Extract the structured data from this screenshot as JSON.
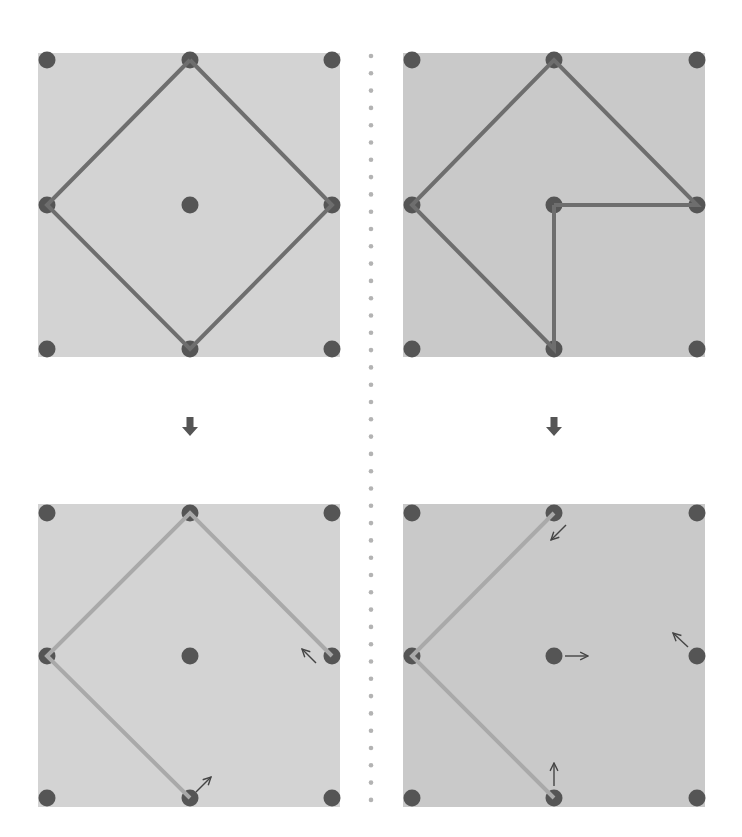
{
  "diagram": {
    "title": "",
    "colors": {
      "background": "#ffffff",
      "panel_left_bg": "#d3d3d3",
      "panel_right_bg": "#c9c9c9",
      "dot": "#555555",
      "line_top": "#6e6e6e",
      "line_bottom": "#a9a9a9",
      "arrow_small": "#444444",
      "arrow_big": "#555555",
      "divider_dot": "#b3b3b3"
    },
    "divider": {
      "x": 371,
      "y_start": 56,
      "y_end": 802,
      "spacing": 17.3,
      "radius": 2.3
    },
    "transition_arrows": [
      {
        "name": "down-arrow-left",
        "x": 190,
        "y": 427
      },
      {
        "name": "down-arrow-right",
        "x": 554,
        "y": 427
      }
    ],
    "panels": [
      {
        "name": "panel-top-left",
        "rect": {
          "x": 38,
          "y": 53,
          "w": 302,
          "h": 304
        },
        "bg": "panel_left_bg",
        "grid_x": [
          47,
          190,
          332
        ],
        "grid_y": [
          60,
          205,
          349
        ],
        "line_color": "line_top",
        "polylines": [
          [
            [
              1,
              0
            ],
            [
              2,
              1
            ],
            [
              1,
              2
            ],
            [
              0,
              1
            ],
            [
              1,
              0
            ]
          ]
        ],
        "small_arrows": []
      },
      {
        "name": "panel-top-right",
        "rect": {
          "x": 403,
          "y": 53,
          "w": 302,
          "h": 304
        },
        "bg": "panel_right_bg",
        "grid_x": [
          412,
          554,
          697
        ],
        "grid_y": [
          60,
          205,
          349
        ],
        "line_color": "line_top",
        "polylines": [
          [
            [
              1,
              1
            ],
            [
              2,
              1
            ],
            [
              1,
              0
            ],
            [
              0,
              1
            ],
            [
              1,
              2
            ],
            [
              1,
              1
            ]
          ]
        ],
        "small_arrows": []
      },
      {
        "name": "panel-bottom-left",
        "rect": {
          "x": 38,
          "y": 504,
          "w": 302,
          "h": 303
        },
        "bg": "panel_left_bg",
        "grid_x": [
          47,
          190,
          332
        ],
        "grid_y": [
          513,
          656,
          798
        ],
        "line_color": "line_bottom",
        "polylines": [
          [
            [
              2,
              1
            ],
            [
              1,
              0
            ],
            [
              0,
              1
            ],
            [
              1,
              2
            ]
          ]
        ],
        "small_arrows": [
          {
            "x1": 316,
            "y1": 663,
            "x2": 302,
            "y2": 649,
            "direction": "up-left"
          },
          {
            "x1": 196,
            "y1": 792,
            "x2": 211,
            "y2": 777,
            "direction": "up-right"
          }
        ]
      },
      {
        "name": "panel-bottom-right",
        "rect": {
          "x": 403,
          "y": 504,
          "w": 302,
          "h": 303
        },
        "bg": "panel_right_bg",
        "grid_x": [
          412,
          554,
          697
        ],
        "grid_y": [
          513,
          656,
          798
        ],
        "line_color": "line_bottom",
        "polylines": [
          [
            [
              1,
              0
            ],
            [
              0,
              1
            ],
            [
              1,
              2
            ]
          ]
        ],
        "small_arrows": [
          {
            "x1": 566,
            "y1": 525,
            "x2": 551,
            "y2": 540,
            "direction": "down-left"
          },
          {
            "x1": 565,
            "y1": 656,
            "x2": 588,
            "y2": 656,
            "direction": "right"
          },
          {
            "x1": 688,
            "y1": 647,
            "x2": 673,
            "y2": 633,
            "direction": "up-left"
          },
          {
            "x1": 554,
            "y1": 786,
            "x2": 554,
            "y2": 763,
            "direction": "up"
          }
        ]
      }
    ]
  }
}
